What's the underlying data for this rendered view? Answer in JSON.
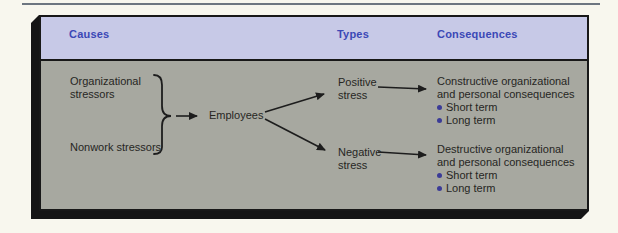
{
  "figure": {
    "columns": [
      {
        "label": "Causes"
      },
      {
        "label": "Types"
      },
      {
        "label": "Consequences"
      }
    ],
    "causes": [
      {
        "line1": "Organizational",
        "line2": "stressors"
      },
      {
        "line1": "Nonwork stressors"
      }
    ],
    "hub_label": "Employees",
    "types": [
      {
        "line1": "Positive",
        "line2": "stress"
      },
      {
        "line1": "Negative",
        "line2": "stress"
      }
    ],
    "consequences": [
      {
        "line1": "Constructive organizational",
        "line2": "and personal consequences",
        "bullets": [
          "Short term",
          "Long term"
        ]
      },
      {
        "line1": "Destructive organizational",
        "line2": "and personal consequences",
        "bullets": [
          "Short term",
          "Long term"
        ]
      }
    ],
    "colors": {
      "page_bg": "#f8f7ee",
      "top_rule": "#6d7680",
      "shadow": "#151515",
      "header_bg": "#c7c9e7",
      "header_text": "#3b48b6",
      "body_bg": "#a7a8a0",
      "body_text": "#26261f",
      "bullet": "#3b3b97",
      "line": "#1d1d1d"
    }
  }
}
